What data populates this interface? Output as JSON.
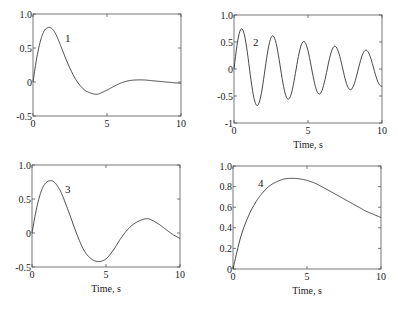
{
  "chart_data": [
    {
      "type": "line",
      "id": "1",
      "curve_label": "1",
      "xlabel": "",
      "ylabel": "",
      "xlim": [
        0,
        10
      ],
      "ylim": [
        -0.5,
        1.0
      ],
      "xticks": [
        "0",
        "5",
        "10"
      ],
      "yticks": [
        "1.0",
        "0.5",
        "0",
        "-0.5"
      ],
      "x": [
        0,
        0.25,
        0.5,
        0.75,
        1.0,
        1.25,
        1.5,
        1.75,
        2.0,
        2.5,
        3.0,
        3.5,
        4.0,
        4.3,
        4.5,
        5.0,
        5.5,
        6.0,
        6.5,
        7.0,
        7.5,
        8.0,
        8.5,
        9.0,
        9.5,
        10.0
      ],
      "values": [
        0,
        0.35,
        0.6,
        0.75,
        0.8,
        0.79,
        0.72,
        0.6,
        0.46,
        0.2,
        0.0,
        -0.12,
        -0.17,
        -0.18,
        -0.17,
        -0.12,
        -0.06,
        -0.01,
        0.02,
        0.03,
        0.03,
        0.02,
        0.01,
        0.0,
        -0.01,
        -0.02
      ],
      "box": {
        "x0": 33,
        "y0": 14,
        "x1": 181,
        "y1": 116
      },
      "label_pos": {
        "x": 65,
        "y": 42
      }
    },
    {
      "type": "line",
      "id": "2",
      "curve_label": "2",
      "xlabel": "Time, s",
      "ylabel": "",
      "xlim": [
        0,
        10
      ],
      "ylim": [
        -1,
        1.0
      ],
      "xticks": [
        "0",
        "5",
        "10"
      ],
      "yticks": [
        "1.0",
        "0.5",
        "0",
        "-0.5",
        "-1"
      ],
      "damped_sine": {
        "amp": 0.78,
        "decay": 0.09,
        "period": 2.1,
        "offset": 0
      },
      "peaks": [
        {
          "x": 0.5,
          "y": 0.68
        },
        {
          "x": 2.6,
          "y": 0.45
        },
        {
          "x": 4.7,
          "y": 0.3
        },
        {
          "x": 6.8,
          "y": 0.18
        },
        {
          "x": 8.9,
          "y": 0.1
        }
      ],
      "troughs": [
        {
          "x": 1.6,
          "y": -0.53
        },
        {
          "x": 3.7,
          "y": -0.37
        },
        {
          "x": 5.8,
          "y": -0.25
        },
        {
          "x": 7.9,
          "y": -0.17
        },
        {
          "x": 10.0,
          "y": -0.12
        }
      ],
      "box": {
        "x0": 234,
        "y0": 15,
        "x1": 382,
        "y1": 123
      },
      "label_pos": {
        "x": 253,
        "y": 46
      }
    },
    {
      "type": "line",
      "id": "3",
      "curve_label": "3",
      "xlabel": "Time, s",
      "ylabel": "",
      "xlim": [
        0,
        10
      ],
      "ylim": [
        -0.5,
        1.0
      ],
      "xticks": [
        "0",
        "5",
        "10"
      ],
      "yticks": [
        "1.0",
        "0.5",
        "0",
        "-0.5"
      ],
      "x": [
        0,
        0.25,
        0.5,
        0.75,
        1.0,
        1.25,
        1.5,
        1.75,
        2.0,
        2.5,
        3.0,
        3.5,
        4.0,
        4.5,
        5.0,
        5.5,
        6.0,
        6.5,
        7.0,
        7.5,
        7.8,
        8.0,
        8.5,
        9.0,
        9.5,
        10.0
      ],
      "values": [
        0,
        0.3,
        0.53,
        0.68,
        0.75,
        0.77,
        0.75,
        0.68,
        0.58,
        0.3,
        0.0,
        -0.25,
        -0.38,
        -0.42,
        -0.38,
        -0.25,
        -0.08,
        0.06,
        0.15,
        0.2,
        0.21,
        0.2,
        0.14,
        0.06,
        -0.02,
        -0.08
      ],
      "box": {
        "x0": 32,
        "y0": 165,
        "x1": 180,
        "y1": 267
      },
      "label_pos": {
        "x": 65,
        "y": 193
      }
    },
    {
      "type": "line",
      "id": "4",
      "curve_label": "4",
      "xlabel": "Time, s",
      "ylabel": "",
      "xlim": [
        0,
        10
      ],
      "ylim": [
        0,
        1.0
      ],
      "xticks": [
        "0",
        "5",
        "10"
      ],
      "yticks": [
        "1.0",
        "0.8",
        "0.6",
        "0.4",
        "0.2",
        "0"
      ],
      "x": [
        0,
        0.5,
        1.0,
        1.5,
        2.0,
        2.5,
        3.0,
        3.5,
        4.0,
        4.5,
        5.0,
        5.5,
        6.0,
        6.5,
        7.0,
        7.5,
        8.0,
        8.5,
        9.0,
        9.5,
        10.0
      ],
      "values": [
        0,
        0.3,
        0.5,
        0.64,
        0.74,
        0.81,
        0.85,
        0.875,
        0.88,
        0.875,
        0.86,
        0.835,
        0.8,
        0.76,
        0.72,
        0.68,
        0.64,
        0.6,
        0.56,
        0.53,
        0.5
      ],
      "box": {
        "x0": 233,
        "y0": 166,
        "x1": 381,
        "y1": 269
      },
      "label_pos": {
        "x": 258,
        "y": 187
      }
    }
  ]
}
